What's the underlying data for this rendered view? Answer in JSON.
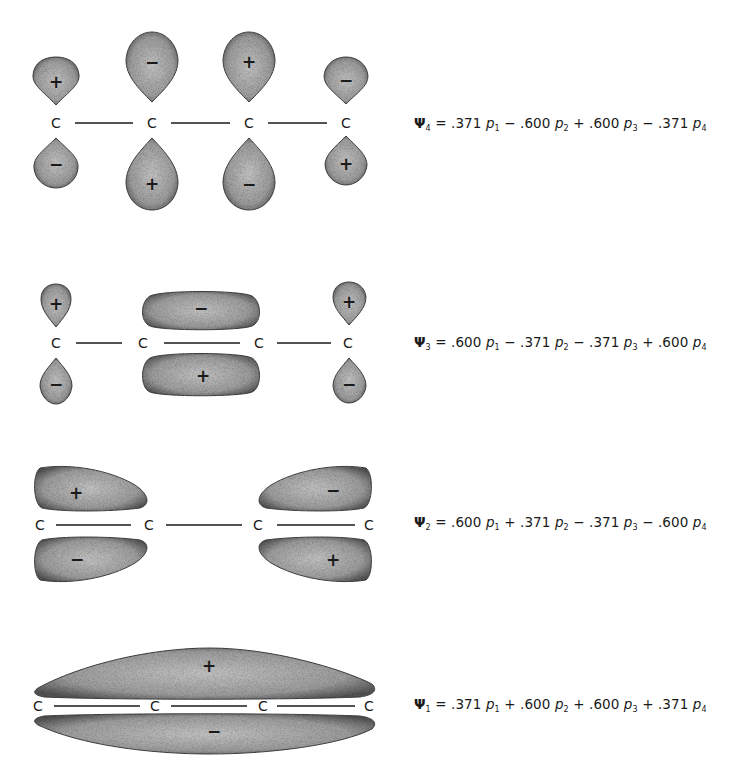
{
  "figure": {
    "atom_label": "C",
    "bond_symbol": "—",
    "colors": {
      "lobe_fill": "#b8b8b8",
      "lobe_edge": "#555555",
      "text": "#1a1a1a",
      "background": "#ffffff"
    }
  },
  "orbitals": [
    {
      "id": "psi4",
      "psi_label": "Ψ",
      "index": "4",
      "terms": [
        {
          "op": "=",
          "coef": ".371",
          "p": "p",
          "sub": "1"
        },
        {
          "op": "−",
          "coef": ".600",
          "p": "p",
          "sub": "2"
        },
        {
          "op": "+",
          "coef": ".600",
          "p": "p",
          "sub": "3"
        },
        {
          "op": "−",
          "coef": ".371",
          "p": "p",
          "sub": "4"
        }
      ],
      "upper_signs": [
        "+",
        "−",
        "+",
        "−"
      ],
      "lower_signs": [
        "−",
        "+",
        "−",
        "+"
      ]
    },
    {
      "id": "psi3",
      "psi_label": "Ψ",
      "index": "3",
      "terms": [
        {
          "op": "=",
          "coef": ".600",
          "p": "p",
          "sub": "1"
        },
        {
          "op": "−",
          "coef": ".371",
          "p": "p",
          "sub": "2"
        },
        {
          "op": "−",
          "coef": ".371",
          "p": "p",
          "sub": "3"
        },
        {
          "op": "+",
          "coef": ".600",
          "p": "p",
          "sub": "4"
        }
      ],
      "upper_signs": [
        "+",
        "−",
        "+"
      ],
      "lower_signs": [
        "−",
        "+",
        "−"
      ]
    },
    {
      "id": "psi2",
      "psi_label": "Ψ",
      "index": "2",
      "terms": [
        {
          "op": "=",
          "coef": ".600",
          "p": "p",
          "sub": "1"
        },
        {
          "op": "+",
          "coef": ".371",
          "p": "p",
          "sub": "2"
        },
        {
          "op": "−",
          "coef": ".371",
          "p": "p",
          "sub": "3"
        },
        {
          "op": "−",
          "coef": ".600",
          "p": "p",
          "sub": "4"
        }
      ],
      "upper_signs": [
        "+",
        "−"
      ],
      "lower_signs": [
        "−",
        "+"
      ]
    },
    {
      "id": "psi1",
      "psi_label": "Ψ",
      "index": "1",
      "terms": [
        {
          "op": "=",
          "coef": ".371",
          "p": "p",
          "sub": "1"
        },
        {
          "op": "+",
          "coef": ".600",
          "p": "p",
          "sub": "2"
        },
        {
          "op": "+",
          "coef": ".600",
          "p": "p",
          "sub": "3"
        },
        {
          "op": "+",
          "coef": ".371",
          "p": "p",
          "sub": "4"
        }
      ],
      "upper_signs": [
        "+"
      ],
      "lower_signs": [
        "−"
      ]
    }
  ]
}
